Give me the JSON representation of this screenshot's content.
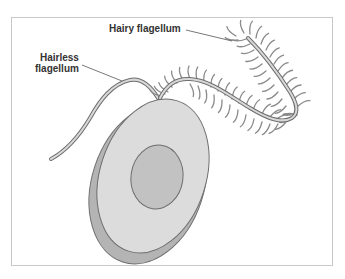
{
  "diagram": {
    "labels": {
      "hairy_flagellum": "Hairy flagellum",
      "hairless_flagellum_line1": "Hairless",
      "hairless_flagellum_line2": "flagellum"
    },
    "colors": {
      "cell_fill": "#dcdcdc",
      "cell_shadow": "#b4b4b4",
      "nucleus_fill": "#c2c2c2",
      "outline": "#6e6e6e",
      "flagellum_fill": "#d8d8d8",
      "hair_color": "#8a8a8a",
      "leader_line": "#555555",
      "frame_border": "#c9c9c9",
      "label_text": "#333333"
    },
    "parts": [
      {
        "name": "cell-body"
      },
      {
        "name": "nucleus"
      },
      {
        "name": "hairless-flagellum"
      },
      {
        "name": "hairy-flagellum"
      }
    ]
  }
}
